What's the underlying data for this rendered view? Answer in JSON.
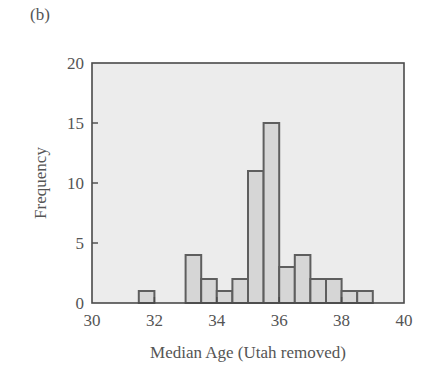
{
  "panel_label": "(b)",
  "chart_data": {
    "type": "bar",
    "subtype": "histogram",
    "title": "",
    "panel": "(b)",
    "xlabel": "Median Age (Utah removed)",
    "ylabel": "Frequency",
    "xlim": [
      30,
      40
    ],
    "ylim": [
      0,
      20
    ],
    "xticks": [
      30,
      32,
      34,
      36,
      38,
      40
    ],
    "yticks": [
      0,
      5,
      10,
      15,
      20
    ],
    "grid": false,
    "legend": null,
    "bin_width": 0.5,
    "bins": [
      {
        "start": 31.5,
        "end": 32.0,
        "count": 1
      },
      {
        "start": 33.0,
        "end": 33.5,
        "count": 4
      },
      {
        "start": 33.5,
        "end": 34.0,
        "count": 2
      },
      {
        "start": 34.0,
        "end": 34.5,
        "count": 1
      },
      {
        "start": 34.5,
        "end": 35.0,
        "count": 2
      },
      {
        "start": 35.0,
        "end": 35.5,
        "count": 11
      },
      {
        "start": 35.5,
        "end": 36.0,
        "count": 15
      },
      {
        "start": 36.0,
        "end": 36.5,
        "count": 3
      },
      {
        "start": 36.5,
        "end": 37.0,
        "count": 4
      },
      {
        "start": 37.0,
        "end": 37.5,
        "count": 2
      },
      {
        "start": 37.5,
        "end": 38.0,
        "count": 2
      },
      {
        "start": 38.0,
        "end": 38.5,
        "count": 1
      },
      {
        "start": 38.5,
        "end": 39.0,
        "count": 1
      }
    ],
    "categories": [
      "31.5-32.0",
      "33.0-33.5",
      "33.5-34.0",
      "34.0-34.5",
      "34.5-35.0",
      "35.0-35.5",
      "35.5-36.0",
      "36.0-36.5",
      "36.5-37.0",
      "37.0-37.5",
      "37.5-38.0",
      "38.0-38.5",
      "38.5-39.0"
    ],
    "values": [
      1,
      4,
      2,
      1,
      2,
      11,
      15,
      3,
      4,
      2,
      2,
      1,
      1
    ],
    "colors": {
      "plot_background": "#ececec",
      "bar_fill": "#d6d6d6",
      "bar_edge": "#5e5e5e",
      "frame": "#4a4a4a"
    }
  }
}
